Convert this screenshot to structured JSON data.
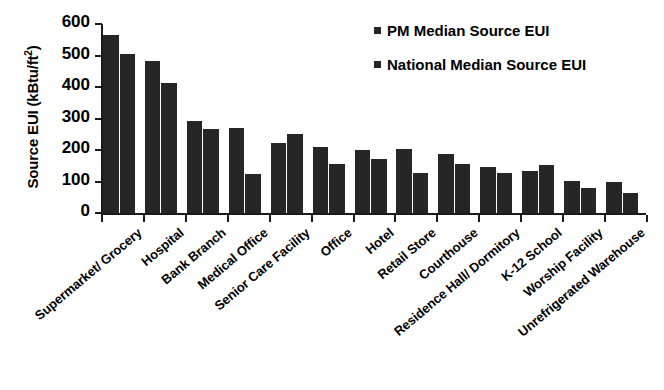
{
  "chart_data": {
    "type": "bar",
    "title": "",
    "xlabel": "",
    "ylabel": "Source EUI (kBtu/ft2)",
    "ylabel_html": "Source EUI (kBtu/ft",
    "ylabel_sup": "2",
    "ylabel_close": ")",
    "ylim": [
      0,
      600
    ],
    "ytick_labels": [
      "600",
      "500",
      "400",
      "300",
      "200",
      "100",
      "0"
    ],
    "ytick_values": [
      600,
      500,
      400,
      300,
      200,
      100,
      0
    ],
    "grid": false,
    "legend_position": "top-right",
    "categories": [
      "Supermarket/ Grocery",
      "Hospital",
      "Bank Branch",
      "Medical Office",
      "Senior Care Facility",
      "Office",
      "Hotel",
      "Retail Store",
      "Courthouse",
      "Residence Hall/ Dormitory",
      "K-12 School",
      "Worship Facility",
      "Unrefrigerated Warehouse"
    ],
    "series": [
      {
        "name": "PM Median Source EUI",
        "color": "#262626",
        "values": [
          565,
          483,
          292,
          271,
          221,
          211,
          201,
          203,
          188,
          145,
          133,
          101,
          98
        ]
      },
      {
        "name": "National Median Source EUI",
        "color": "#262626",
        "values": [
          506,
          414,
          268,
          123,
          250,
          156,
          172,
          127,
          155,
          126,
          151,
          79,
          64
        ]
      }
    ]
  },
  "legend": {
    "items": [
      {
        "label": "PM Median Source EUI"
      },
      {
        "label": "National Median Source EUI"
      }
    ]
  }
}
